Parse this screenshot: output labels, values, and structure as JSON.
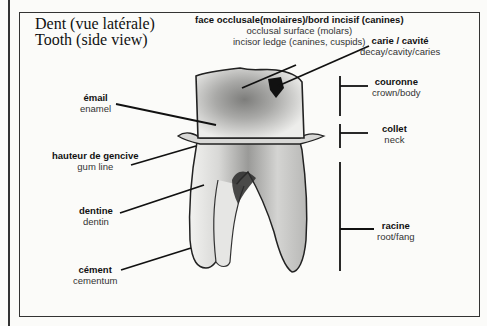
{
  "title": {
    "fr": "Dent (vue latérale)",
    "en": "Tooth (side view)"
  },
  "labels": {
    "occlusal": {
      "fr": "face occlusale(molaires)/bord incisif (canines)",
      "en1": "occlusal surface (molars)",
      "en2": "incisor ledge (canines, cuspids)"
    },
    "caries": {
      "fr": "carie / cavité",
      "en": "decay/cavity/caries"
    },
    "enamel": {
      "fr": "émail",
      "en": "enamel"
    },
    "gumline": {
      "fr": "hauteur de gencive",
      "en": "gum line"
    },
    "dentin": {
      "fr": "dentine",
      "en": "dentin"
    },
    "cementum": {
      "fr": "cément",
      "en": "cementum"
    },
    "crown": {
      "fr": "couronne",
      "en": "crown/body"
    },
    "neck": {
      "fr": "collet",
      "en": "neck"
    },
    "root": {
      "fr": "racine",
      "en": "root/fang"
    }
  },
  "colors": {
    "ink": "#1a1a1a",
    "paper": "#fbfbf9",
    "tooth_light": "#ececea",
    "tooth_shade": "#8a8a88",
    "cavity": "#111111"
  }
}
